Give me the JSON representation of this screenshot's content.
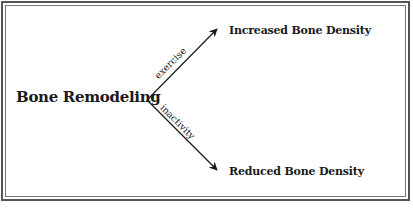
{
  "diagram": {
    "type": "branching-flow",
    "root": {
      "label": "Bone Remodeling"
    },
    "branches": [
      {
        "edge_label": "exercise",
        "target": "Increased Bone Density",
        "direction": "up-right"
      },
      {
        "edge_label": "inactivity",
        "target": "Reduced Bone Density",
        "direction": "down-right"
      }
    ],
    "colors": {
      "ink": "#1a1a1a",
      "frame": "#555555",
      "background": "#ffffff"
    }
  }
}
